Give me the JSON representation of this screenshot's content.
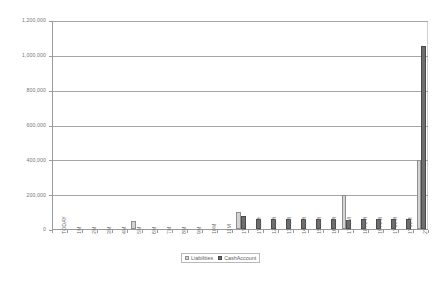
{
  "chart_data": {
    "type": "bar",
    "title": "",
    "xlabel": "",
    "ylabel": "",
    "ylim": [
      0,
      1200000
    ],
    "ytick_values": [
      0,
      200000,
      400000,
      600000,
      800000,
      1000000,
      1200000
    ],
    "ytick_labels": [
      "0",
      "200,000",
      "400,000",
      "600,000",
      "800,000",
      "1,000,000",
      "1,200,000"
    ],
    "grid": true,
    "legend_position": "bottom",
    "categories": [
      "TODAY",
      "1M",
      "2M",
      "3M",
      "4M",
      "5M",
      "6M",
      "7M",
      "8M",
      "9M",
      "10M",
      "11M",
      "1Y",
      "1Y11M",
      "12Y3M",
      "13Y2M",
      "14Y5M",
      "15Y6M",
      "16Y4M",
      "17Y3M",
      "18Y2M",
      "19Y5M",
      "1Y10M",
      "1Y11M",
      "2Y"
    ],
    "series": [
      {
        "name": "Liabilities",
        "color": "#d3d3d3",
        "values": [
          0,
          0,
          0,
          0,
          0,
          48000,
          0,
          0,
          0,
          0,
          0,
          0,
          96000,
          0,
          0,
          0,
          0,
          0,
          0,
          196000,
          0,
          0,
          0,
          0,
          398000
        ]
      },
      {
        "name": "CashAccount",
        "color": "#6e6e6e",
        "values": [
          0,
          0,
          0,
          0,
          0,
          0,
          0,
          0,
          0,
          0,
          0,
          0,
          74000,
          56000,
          58000,
          57000,
          57000,
          57000,
          57000,
          52000,
          57000,
          57000,
          57000,
          57000,
          1048000
        ]
      }
    ],
    "legend": [
      "Liabilities",
      "CashAccount"
    ]
  }
}
